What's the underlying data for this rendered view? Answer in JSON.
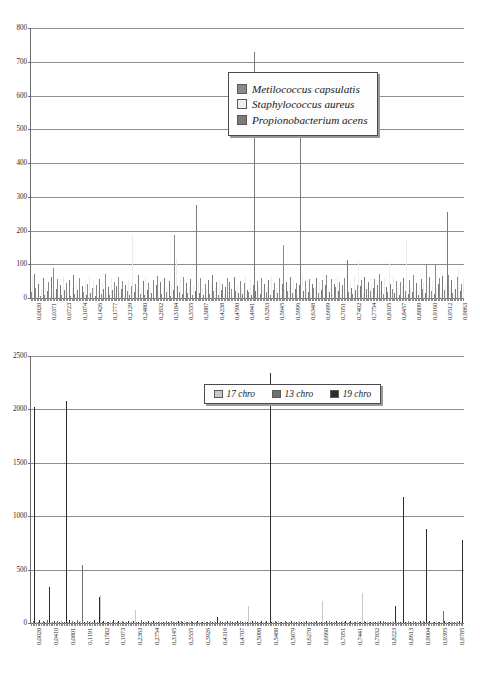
{
  "page": {
    "background": "#ffffff"
  },
  "colors": {
    "axis": "#6b6b6b",
    "grid": "#8d8d8d",
    "series_light": "#c9c9c9",
    "series_mid": "#8a8a8a",
    "series_dark": "#4a4a4a",
    "text": "#1a1a1a",
    "legend_border": "#4a4a4a",
    "legend_bg": "#fdfdfd"
  },
  "chart_data": [
    {
      "id": "chart-1",
      "type": "bar",
      "title": "",
      "xlabel": "",
      "ylabel": "",
      "ylim": [
        0,
        800
      ],
      "yticks": [
        0,
        100,
        200,
        300,
        400,
        500,
        600,
        700,
        800
      ],
      "grid": true,
      "legend_position": "upper-right-inside",
      "legend": [
        {
          "label": "Metilococcus capsulatis",
          "color": "#8a8a8a"
        },
        {
          "label": "Staphylococcus aureus",
          "color": "#ededed"
        },
        {
          "label": "Propionobacterium acens",
          "color": "#7a7a7a"
        }
      ],
      "xtick_labels": [
        "0,0020",
        "0,0371",
        "0,0723",
        "0,1074",
        "0,1426",
        "0,1777",
        "0,2129",
        "0,2480",
        "0,2832",
        "0,3184",
        "0,3535",
        "0,3887",
        "0,4238",
        "0,4590",
        "0,4941",
        "0,5293",
        "0,5645",
        "0,5996",
        "0,6348",
        "0,6699",
        "0,7051",
        "0,7402",
        "0,7754",
        "0,8105",
        "0,8457",
        "0,8809",
        "0,9160",
        "0,9512",
        "0,9863"
      ],
      "xlim": [
        0.0,
        1.0
      ],
      "xtick_start": 0.002,
      "xtick_step": 0.035156,
      "n_points": 284,
      "values": [
        18,
        64,
        71,
        30,
        12,
        42,
        6,
        28,
        58,
        9,
        34,
        20,
        47,
        5,
        62,
        88,
        14,
        26,
        55,
        11,
        39,
        8,
        61,
        23,
        44,
        17,
        52,
        7,
        31,
        69,
        13,
        48,
        25,
        60,
        10,
        36,
        19,
        54,
        9,
        41,
        66,
        15,
        29,
        50,
        6,
        38,
        22,
        57,
        12,
        45,
        27,
        70,
        16,
        33,
        8,
        59,
        24,
        46,
        11,
        35,
        63,
        14,
        28,
        51,
        7,
        40,
        21,
        56,
        10,
        37,
        190,
        18,
        43,
        26,
        67,
        13,
        32,
        49,
        9,
        61,
        23,
        44,
        30,
        15,
        53,
        8,
        38,
        65,
        20,
        47,
        12,
        34,
        58,
        17,
        29,
        50,
        6,
        42,
        25,
        188,
        118,
        36,
        19,
        54,
        11,
        62,
        27,
        45,
        14,
        33,
        57,
        9,
        40,
        22,
        276,
        48,
        16,
        60,
        31,
        10,
        43,
        26,
        52,
        13,
        37,
        68,
        20,
        29,
        46,
        8,
        55,
        24,
        41,
        12,
        34,
        59,
        18,
        47,
        28,
        7,
        63,
        22,
        39,
        15,
        51,
        30,
        11,
        44,
        66,
        25,
        17,
        56,
        9,
        38,
        728,
        21,
        49,
        32,
        13,
        60,
        27,
        43,
        19,
        36,
        54,
        10,
        64,
        23,
        45,
        30,
        16,
        58,
        12,
        41,
        157,
        28,
        48,
        20,
        35,
        62,
        14,
        52,
        26,
        44,
        9,
        39,
        647,
        67,
        22,
        50,
        31,
        18,
        57,
        11,
        43,
        29,
        37,
        60,
        15,
        47,
        24,
        53,
        8,
        40,
        69,
        27,
        19,
        56,
        13,
        42,
        34,
        63,
        21,
        48,
        10,
        38,
        58,
        25,
        112,
        17,
        45,
        30,
        12,
        66,
        23,
        40,
        108,
        35,
        52,
        16,
        61,
        28,
        9,
        47,
        20,
        43,
        31,
        55,
        14,
        38,
        70,
        24,
        49,
        11,
        59,
        33,
        18,
        106,
        42,
        26,
        64,
        15,
        51,
        29,
        8,
        46,
        37,
        60,
        22,
        172,
        13,
        54,
        31,
        19,
        68,
        25,
        44,
        10,
        39,
        57,
        27,
        48,
        16,
        102,
        35,
        62,
        21,
        50,
        12,
        99,
        30,
        43,
        58,
        17,
        65,
        23,
        40,
        255,
        69,
        34,
        52,
        14,
        47,
        26,
        61,
        88,
        20,
        41,
        56
      ]
    },
    {
      "id": "chart-2",
      "type": "bar",
      "title": "",
      "xlabel": "",
      "ylabel": "",
      "ylim": [
        0,
        2500
      ],
      "yticks": [
        0,
        500,
        1000,
        1500,
        2000,
        2500
      ],
      "grid": true,
      "legend_position": "upper-center",
      "legend": [
        {
          "label": "17 chro",
          "color": "#c9c9c9"
        },
        {
          "label": "13 chro",
          "color": "#707070"
        },
        {
          "label": "19 chro",
          "color": "#2b2b2b"
        }
      ],
      "xtick_labels": [
        "0,0020",
        "0,0410",
        "0,0801",
        "0,1191",
        "0,1582",
        "0,1973",
        "0,2363",
        "0,2754",
        "0,3145",
        "0,3535",
        "0,3926",
        "0,4316",
        "0,4707",
        "0,5098",
        "0,5488",
        "0,5879",
        "0,6270",
        "0,6660",
        "0,7051",
        "0,7441",
        "0,7832",
        "0,8223",
        "0,8613",
        "0,9004",
        "0,9395",
        "0,9785"
      ],
      "xlim": [
        0.0,
        1.0
      ],
      "xtick_start": 0.002,
      "xtick_step": 0.039063,
      "n_points": 256,
      "values": [
        8,
        22,
        2020,
        14,
        9,
        31,
        6,
        18,
        11,
        5,
        26,
        333,
        12,
        7,
        20,
        4,
        15,
        9,
        28,
        6,
        13,
        2082,
        10,
        24,
        8,
        17,
        5,
        12,
        30,
        7,
        19,
        540,
        11,
        6,
        23,
        9,
        16,
        4,
        27,
        8,
        14,
        240,
        262,
        10,
        21,
        7,
        13,
        5,
        18,
        9,
        25,
        6,
        11,
        17,
        4,
        22,
        8,
        14,
        6,
        19,
        10,
        5,
        16,
        120,
        9,
        12,
        7,
        24,
        5,
        15,
        8,
        20,
        6,
        11,
        17,
        4,
        13,
        9,
        22,
        7,
        14,
        5,
        18,
        10,
        6,
        16,
        8,
        12,
        4,
        21,
        9,
        15,
        6,
        19,
        7,
        11,
        5,
        23,
        8,
        13,
        10,
        17,
        6,
        14,
        4,
        20,
        9,
        12,
        7,
        16,
        5,
        22,
        8,
        60,
        11,
        18,
        6,
        13,
        9,
        15,
        4,
        21,
        7,
        12,
        10,
        17,
        5,
        19,
        8,
        14,
        6,
        11,
        155,
        9,
        16,
        4,
        20,
        7,
        13,
        5,
        18,
        10,
        8,
        15,
        6,
        2345,
        12,
        9,
        17,
        5,
        21,
        7,
        14,
        4,
        19,
        8,
        11,
        6,
        16,
        9,
        13,
        5,
        18,
        7,
        10,
        22,
        6,
        15,
        8,
        12,
        4,
        20,
        9,
        17,
        5,
        13,
        7,
        210,
        11,
        16,
        6,
        19,
        8,
        14,
        4,
        21,
        9,
        12,
        7,
        18,
        5,
        15,
        10,
        6,
        22,
        8,
        13,
        4,
        17,
        9,
        11,
        280,
        16,
        6,
        20,
        7,
        14,
        5,
        12,
        9,
        18,
        8,
        15,
        4,
        21,
        10,
        6,
        13,
        7,
        17,
        5,
        160,
        19,
        9,
        12,
        6,
        1180,
        14,
        8,
        20,
        5,
        11,
        16,
        7,
        13,
        4,
        18,
        9,
        15,
        6,
        878,
        10,
        21,
        8,
        12,
        5,
        17,
        7,
        14,
        9,
        110,
        19,
        6,
        13,
        4,
        16,
        8,
        11,
        20,
        7,
        15,
        5,
        775
      ]
    }
  ]
}
